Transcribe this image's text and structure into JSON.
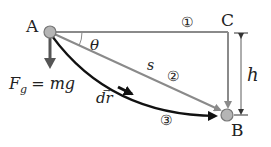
{
  "diagram": {
    "points": {
      "A": {
        "label": "A",
        "x": 50,
        "y": 32
      },
      "B": {
        "label": "B",
        "x": 228,
        "y": 115
      },
      "C": {
        "label": "C",
        "x": 228,
        "y": 32
      }
    },
    "paths": [
      {
        "id": 1,
        "marker": "①",
        "description": "A to C horizontally, then C down to B"
      },
      {
        "id": 2,
        "marker": "②",
        "description": "straight incline from A to B",
        "length_label": "s"
      },
      {
        "id": 3,
        "marker": "③",
        "description": "curved path from A to B"
      }
    ],
    "labels": {
      "angle": "θ",
      "force_lhs": "F",
      "force_sub": "g",
      "force_rhs": "= mg",
      "displacement": "dr",
      "displacement_arrow": "→",
      "height": "h",
      "slope_length": "s"
    },
    "colors": {
      "gray_path": "#8a8a8a",
      "dark_path": "#111111",
      "ball_fill": "#b5b5b5",
      "ball_stroke": "#777777",
      "force_arrow": "#555555",
      "text": "#222222"
    }
  }
}
